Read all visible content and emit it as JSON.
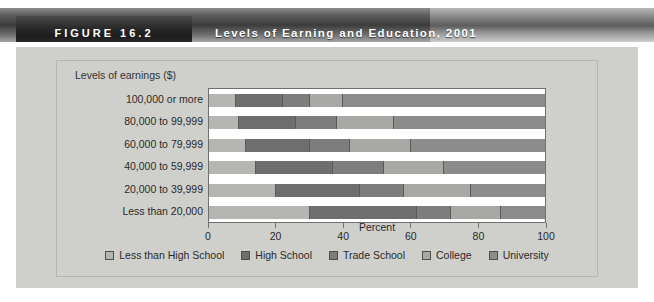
{
  "figure": {
    "number_label": "FIGURE 16.2",
    "title": "Levels of Earning and Education, 2001"
  },
  "chart_data": {
    "type": "bar",
    "orientation": "horizontal",
    "stacked": true,
    "stack_mode": "percent",
    "title": "Levels of Earning and Education, 2001",
    "xlabel": "Percent",
    "ylabel": "Levels of earnings ($)",
    "xlim": [
      0,
      100
    ],
    "xticks": [
      0,
      20,
      40,
      60,
      80,
      100
    ],
    "xtick_labels": [
      "0",
      "20",
      "40",
      "60",
      "80",
      "100"
    ],
    "grid": false,
    "legend_position": "bottom",
    "categories": [
      "100,000 or more",
      "80,000 to 99,999",
      "60,000 to 79,999",
      "40,000 to 59,999",
      "20,000 to 39,999",
      "Less than 20,000"
    ],
    "series": [
      {
        "name": "Less than High School",
        "color": "#b5b5b1",
        "values": [
          8,
          9,
          11,
          14,
          20,
          30
        ]
      },
      {
        "name": "High School",
        "color": "#6e6e6e",
        "values": [
          14,
          17,
          19,
          23,
          25,
          32
        ]
      },
      {
        "name": "Trade School",
        "color": "#7d7d7d",
        "values": [
          8,
          12,
          12,
          15,
          13,
          10
        ]
      },
      {
        "name": "College",
        "color": "#a8a8a4",
        "values": [
          10,
          17,
          18,
          18,
          20,
          15
        ]
      },
      {
        "name": "University",
        "color": "#8c8c8c",
        "values": [
          60,
          45,
          40,
          30,
          22,
          13
        ]
      }
    ]
  },
  "legend": {
    "items": [
      {
        "label": "Less than High School",
        "color": "#b5b5b1"
      },
      {
        "label": "High School",
        "color": "#6e6e6e"
      },
      {
        "label": "Trade School",
        "color": "#7d7d7d"
      },
      {
        "label": "College",
        "color": "#a8a8a4"
      },
      {
        "label": "University",
        "color": "#8c8c8c"
      }
    ]
  },
  "colors": {
    "panel_background": "#cfcfcb",
    "plot_background": "#ffffff",
    "axis_line": "#6f6f6f",
    "banner_dark": "#2a2a2a",
    "text": "#2a2a2a"
  }
}
